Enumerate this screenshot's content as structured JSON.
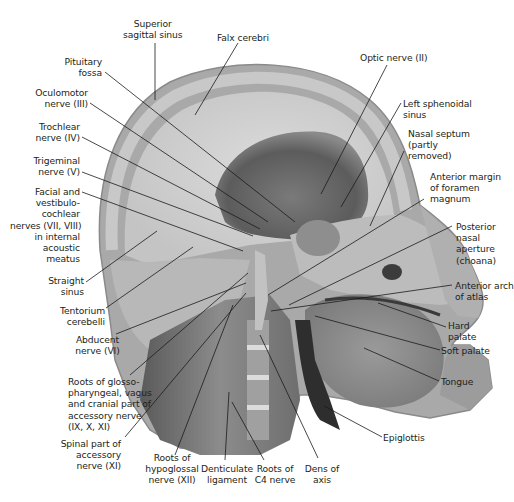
{
  "figure": {
    "type": "anatomical sagittal section of head and neck (grayscale photograph)",
    "colors": {
      "background": "#ffffff",
      "text": "#231f20",
      "leader_lines": "#1a1a1a"
    }
  },
  "labels": {
    "superior_sagittal_sinus": "Superior\nsagittal sinus",
    "falx_cerebri": "Falx cerebri",
    "pituitary_fossa": "Pituitary\nfossa",
    "oculomotor_nerve": "Oculomotor\nnerve (III)",
    "trochlear_nerve": "Trochlear\nnerve (IV)",
    "trigeminal_nerve": "Trigeminal\nnerve (V)",
    "facial_vestibulocochlear": "Facial and\nvestibulo-\ncochlear\nnerves (VII, VIII)\nin internal\nacoustic\nmeatus",
    "straight_sinus": "Straight\nsinus",
    "tentorium_cerebelli": "Tentorium\ncerebelli",
    "abducent_nerve": "Abducent\nnerve (VI)",
    "roots_glossopharyngeal": "Roots of glosso-\npharyngeal, vagus\nand cranial part of\naccessory nerve\n(IX, X, XI)",
    "spinal_accessory": "Spinal part of\naccessory\nnerve (XI)",
    "roots_hypoglossal": "Roots of\nhypoglossal\nnerve (XII)",
    "denticulate_ligament": "Denticulate\nligament",
    "roots_c4": "Roots of\nC4 nerve",
    "dens_of_axis": "Dens of\naxis",
    "optic_nerve": "Optic nerve (II)",
    "left_sphenoidal_sinus": "Left sphenoidal\nsinus",
    "nasal_septum": "Nasal septum\n(partly\nremoved)",
    "anterior_margin_foramen": "Anterior margin\nof foramen\nmagnum",
    "posterior_nasal_aperture": "Posterior\nnasal\naperture\n(choana)",
    "anterior_arch_atlas": "Anterior arch\nof atlas",
    "hard_palate": "Hard\npalate",
    "soft_palate": "Soft palate",
    "tongue": "Tongue",
    "epiglottis": "Epiglottis"
  }
}
